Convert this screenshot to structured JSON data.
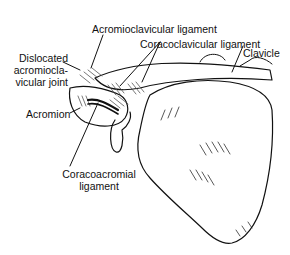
{
  "diagram": {
    "labels": {
      "acromioclavicular_ligament": "Acromioclavicular ligament",
      "coracoclavicular_ligament": "Coracoclavicular ligament",
      "clavicle": "Clavicle",
      "dislocated_joint_line1": "Dislocated",
      "dislocated_joint_line2": "acromiocla-",
      "dislocated_joint_line3": "vicular joint",
      "acromion": "Acromion",
      "coracoacromial_line1": "Coracoacromial",
      "coracoacromial_line2": "ligament"
    },
    "colors": {
      "line": "#111111",
      "background": "#ffffff"
    }
  }
}
